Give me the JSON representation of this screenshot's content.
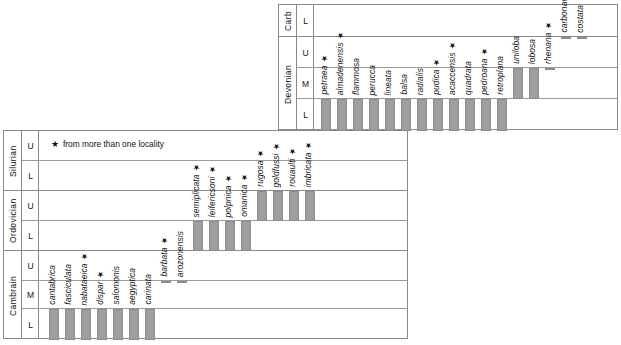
{
  "figure": {
    "legend_star": "★",
    "legend_text": "from more than one locality"
  },
  "lower_block": {
    "periods": [
      {
        "name": "Silurian",
        "epochs": [
          "U",
          "L"
        ]
      },
      {
        "name": "Ordovician",
        "epochs": [
          "U",
          "L"
        ]
      },
      {
        "name": "Cambrain",
        "epochs": [
          "U",
          "M",
          "L"
        ]
      }
    ]
  },
  "upper_block": {
    "periods": [
      {
        "name": "Carb",
        "epochs": [
          "L"
        ]
      },
      {
        "name": "Devonian",
        "epochs": [
          "U",
          "M",
          "L"
        ]
      }
    ]
  },
  "chart_data": {
    "type": "range-chart",
    "xlabel": "",
    "ylabel": "Geologic period / epoch",
    "legend": [
      {
        "symbol": "★",
        "label": "from more than one locality"
      }
    ],
    "bar_color": "#9e9e9e",
    "lower_axis_levels": [
      "Silurian U",
      "Silurian L",
      "Ordovician U",
      "Ordovician L",
      "Cambrain U",
      "Cambrain M",
      "Cambrain L"
    ],
    "upper_axis_levels": [
      "Carb L",
      "Devonian U",
      "Devonian M",
      "Devonian L"
    ],
    "taxa_lower_block": [
      {
        "name": "cantabrica",
        "star": false,
        "range": [
          "Cambrain L",
          "Cambrain L"
        ]
      },
      {
        "name": "fasciculata",
        "star": false,
        "range": [
          "Cambrain L",
          "Cambrain L"
        ]
      },
      {
        "name": "nabataeica",
        "star": true,
        "range": [
          "Cambrain L",
          "Cambrain L"
        ]
      },
      {
        "name": "dispar",
        "star": true,
        "range": [
          "Cambrain L",
          "Cambrain L"
        ]
      },
      {
        "name": "salomonis",
        "star": false,
        "range": [
          "Cambrain L",
          "Cambrain L"
        ]
      },
      {
        "name": "aegyptica",
        "star": false,
        "range": [
          "Cambrain L",
          "Cambrain L"
        ]
      },
      {
        "name": "carinata",
        "star": false,
        "range": [
          "Cambrain L",
          "Cambrain L"
        ]
      },
      {
        "name": "barbata",
        "star": true,
        "range": [
          "Cambrain M",
          "Cambrain U"
        ]
      },
      {
        "name": "arozonensis",
        "star": false,
        "range": [
          "Cambrain M",
          "Cambrain U"
        ]
      },
      {
        "name": "semiplicata",
        "star": true,
        "range": [
          "Ordovician L",
          "Ordovician L"
        ]
      },
      {
        "name": "leifericsoni",
        "star": true,
        "range": [
          "Ordovician L",
          "Ordovician L"
        ]
      },
      {
        "name": "polpnica",
        "star": true,
        "range": [
          "Ordovician L",
          "Ordovician L"
        ]
      },
      {
        "name": "omanica",
        "star": true,
        "range": [
          "Ordovician L",
          "Ordovician L"
        ]
      },
      {
        "name": "rugosa",
        "star": true,
        "range": [
          "Ordovician U",
          "Ordovician U"
        ]
      },
      {
        "name": "goldfussi",
        "star": true,
        "range": [
          "Ordovician U",
          "Ordovician U"
        ]
      },
      {
        "name": "rouaulti",
        "star": true,
        "range": [
          "Ordovician U",
          "Ordovician U"
        ]
      },
      {
        "name": "imbricata",
        "star": true,
        "range": [
          "Ordovician U",
          "Ordovician U"
        ]
      }
    ],
    "taxa_upper_block": [
      {
        "name": "petraea",
        "star": true,
        "range": [
          "Devonian L",
          "Devonian L"
        ]
      },
      {
        "name": "almadenensis",
        "star": true,
        "range": [
          "Devonian L",
          "Devonian L"
        ]
      },
      {
        "name": "flammosa",
        "star": false,
        "range": [
          "Devonian L",
          "Devonian L"
        ]
      },
      {
        "name": "perucca",
        "star": false,
        "range": [
          "Devonian L",
          "Devonian L"
        ]
      },
      {
        "name": "lineata",
        "star": false,
        "range": [
          "Devonian L",
          "Devonian L"
        ]
      },
      {
        "name": "balsa",
        "star": false,
        "range": [
          "Devonian L",
          "Devonian L"
        ]
      },
      {
        "name": "radialis",
        "star": false,
        "range": [
          "Devonian L",
          "Devonian L"
        ]
      },
      {
        "name": "pudica",
        "star": true,
        "range": [
          "Devonian L",
          "Devonian L"
        ]
      },
      {
        "name": "acaccensis",
        "star": true,
        "range": [
          "Devonian L",
          "Devonian L"
        ]
      },
      {
        "name": "quadrata",
        "star": false,
        "range": [
          "Devonian L",
          "Devonian L"
        ]
      },
      {
        "name": "pedroana",
        "star": true,
        "range": [
          "Devonian L",
          "Devonian L"
        ]
      },
      {
        "name": "retroplana",
        "star": false,
        "range": [
          "Devonian L",
          "Devonian L"
        ]
      },
      {
        "name": "uniloba",
        "star": false,
        "range": [
          "Devonian M",
          "Devonian M"
        ]
      },
      {
        "name": "lobosa",
        "star": false,
        "range": [
          "Devonian M",
          "Devonian M"
        ]
      },
      {
        "name": "rhenana",
        "star": true,
        "range": [
          "Devonian M",
          "Devonian U"
        ]
      },
      {
        "name": "carbonaria",
        "star": false,
        "range": [
          "Devonian U",
          "Carb L"
        ]
      },
      {
        "name": "costata",
        "star": false,
        "range": [
          "Devonian U",
          "Carb L"
        ]
      }
    ]
  },
  "layout": {
    "lower_block": {
      "x": 3,
      "y": 130,
      "w": 405,
      "h": 209,
      "period_col_w": 18,
      "epoch_col_w": 17,
      "row_y": [
        130,
        160,
        190,
        220,
        250,
        280,
        308,
        339
      ],
      "bar_w": 10,
      "bar_gap": 6,
      "bars_x0": 48
    },
    "upper_block": {
      "x": 278,
      "y": 4,
      "w": 340,
      "h": 126,
      "period_col_w": 18,
      "epoch_col_w": 17,
      "row_y": [
        4,
        36,
        67,
        98,
        130
      ],
      "bar_w": 10,
      "bar_gap": 6,
      "bars_x0": 320
    }
  }
}
